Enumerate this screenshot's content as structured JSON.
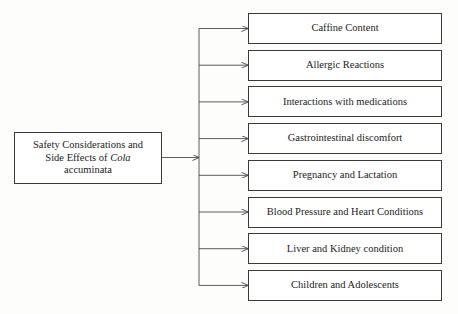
{
  "diagram": {
    "type": "hierarchy-tree",
    "orientation": "left-to-right",
    "root": {
      "line1": "Safety Considerations and",
      "line2_prefix": "Side Effects of ",
      "line2_italic": "Cola",
      "line3": "accuminata"
    },
    "branches": [
      {
        "label": "Caffine Content"
      },
      {
        "label": "Allergic Reactions"
      },
      {
        "label": "Interactions with medications"
      },
      {
        "label": "Gastrointestinal discomfort"
      },
      {
        "label": "Pregnancy and Lactation"
      },
      {
        "label": "Blood Pressure and Heart Conditions"
      },
      {
        "label": "Liver and Kidney condition"
      },
      {
        "label": "Children and Adolescents"
      }
    ],
    "colors": {
      "background": "#fdfdfc",
      "node_fill": "#ffffff",
      "node_border": "#3a3a3a",
      "connector": "#4a4a4a",
      "text": "#1c1c1c"
    }
  }
}
